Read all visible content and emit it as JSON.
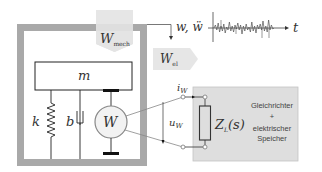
{
  "diagram": {
    "colors": {
      "frame": "#a9a9a9",
      "arrow_fill": "#e6e6e6",
      "load_box_fill": "#dedede",
      "line": "#333333",
      "generator_fill": "#f2f2f2"
    },
    "labels": {
      "mass": "m",
      "spring": "k",
      "damper": "b",
      "generator": "W",
      "w_mech_main": "W",
      "w_mech_sub": "mech",
      "w_el_main": "W",
      "w_el_sub": "el",
      "excitation": "w, ẅ",
      "time_axis": "t",
      "current_main": "i",
      "current_sub": "W",
      "voltage_main": "u",
      "voltage_sub": "W",
      "impedance_main": "Z",
      "impedance_sub": "L",
      "impedance_arg": "(s)",
      "load_line1": "Gleichrichter",
      "load_line2": "+",
      "load_line3": "elektrischer",
      "load_line4": "Speicher"
    },
    "excitation_signal": [
      0,
      -3,
      2,
      -5,
      4,
      -2,
      3,
      -4,
      5,
      -1,
      2,
      -6,
      3,
      -2,
      4,
      -3,
      1,
      -5,
      2,
      -3,
      6,
      -2,
      3,
      -4,
      2,
      -1,
      4,
      -6,
      3,
      -2,
      5,
      -3,
      1,
      -4,
      2,
      -7,
      3,
      -2,
      4,
      -8,
      2,
      -3,
      1,
      0
    ]
  }
}
